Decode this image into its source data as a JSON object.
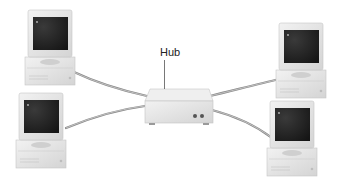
{
  "diagram": {
    "type": "star-network-topology",
    "hub": {
      "label": "Hub"
    },
    "nodes": [
      {
        "id": "computer-top-left"
      },
      {
        "id": "computer-bottom-left"
      },
      {
        "id": "computer-top-right"
      },
      {
        "id": "computer-bottom-right"
      }
    ],
    "connections": [
      {
        "from": "computer-top-left",
        "to": "hub"
      },
      {
        "from": "computer-bottom-left",
        "to": "hub"
      },
      {
        "from": "computer-top-right",
        "to": "hub"
      },
      {
        "from": "computer-bottom-right",
        "to": "hub"
      }
    ]
  },
  "colors": {
    "background": "#ffffff",
    "cable": "#8a8a8a",
    "case": "#e6e6e6",
    "case_shadow": "#c8c8c8",
    "screen": "#2a2a2a"
  }
}
